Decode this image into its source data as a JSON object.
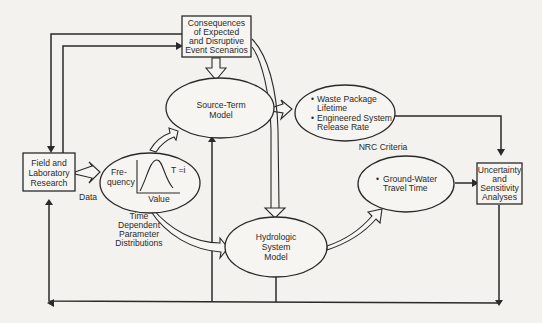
{
  "nodes": {
    "consequences": {
      "lines": [
        "Consequences",
        "of Expected",
        "and Disruptive",
        "Event Scenarios"
      ]
    },
    "field_lab": {
      "lines": [
        "Field and",
        "Laboratory",
        "Research"
      ]
    },
    "source_term": {
      "lines": [
        "Source-Term",
        "Model"
      ]
    },
    "parameter_dist": {
      "ylabel_lines": [
        "Fre-",
        "quency"
      ],
      "xlabel": "Value",
      "curve_label": "T =i"
    },
    "hydrologic": {
      "lines": [
        "Hydrologic",
        "System",
        "Model"
      ]
    },
    "waste_package": {
      "bullets": [
        {
          "bullet": "•",
          "lines": [
            "Waste Package",
            "Lifetime"
          ]
        },
        {
          "bullet": "•",
          "lines": [
            "Engineered System",
            "Release Rate"
          ]
        }
      ]
    },
    "ground_water": {
      "bullet": "•",
      "lines": [
        "Ground-Water",
        "Travel Time"
      ]
    },
    "uncertainty": {
      "lines": [
        "Uncertainty",
        "and",
        "Sensitivity",
        "Analyses"
      ]
    }
  },
  "labels": {
    "data": "Data",
    "time_dependent": [
      "Time",
      "Dependent",
      "Parameter",
      "Distributions"
    ],
    "nrc_criteria": "NRC Criteria"
  }
}
